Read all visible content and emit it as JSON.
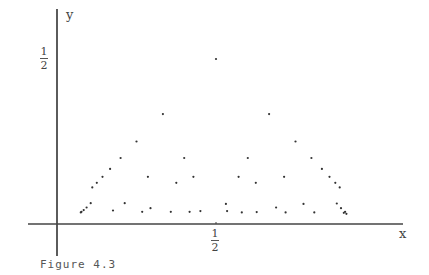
{
  "chart_data": {
    "type": "scatter",
    "title": "",
    "caption": "Figure 4.3",
    "xlabel": "x",
    "ylabel": "y",
    "xlim": [
      0,
      1
    ],
    "ylim": [
      0,
      0.5
    ],
    "grid": false,
    "legend": null,
    "x_ticks": [
      {
        "value": 0.5,
        "label_num": "1",
        "label_den": "2"
      }
    ],
    "y_ticks": [
      {
        "value": 0.5,
        "label_num": "1",
        "label_den": "2"
      }
    ],
    "points": [
      {
        "x": 0.5,
        "y": 0.5
      },
      {
        "x": 0.333,
        "y": 0.333
      },
      {
        "x": 0.667,
        "y": 0.333
      },
      {
        "x": 0.25,
        "y": 0.25
      },
      {
        "x": 0.75,
        "y": 0.25
      },
      {
        "x": 0.2,
        "y": 0.2
      },
      {
        "x": 0.4,
        "y": 0.2
      },
      {
        "x": 0.6,
        "y": 0.2
      },
      {
        "x": 0.8,
        "y": 0.2
      },
      {
        "x": 0.167,
        "y": 0.167
      },
      {
        "x": 0.833,
        "y": 0.167
      },
      {
        "x": 0.143,
        "y": 0.143
      },
      {
        "x": 0.286,
        "y": 0.143
      },
      {
        "x": 0.429,
        "y": 0.143
      },
      {
        "x": 0.571,
        "y": 0.143
      },
      {
        "x": 0.714,
        "y": 0.143
      },
      {
        "x": 0.857,
        "y": 0.143
      },
      {
        "x": 0.125,
        "y": 0.125
      },
      {
        "x": 0.375,
        "y": 0.125
      },
      {
        "x": 0.625,
        "y": 0.125
      },
      {
        "x": 0.875,
        "y": 0.125
      },
      {
        "x": 0.111,
        "y": 0.111
      },
      {
        "x": 0.889,
        "y": 0.111
      },
      {
        "x": 0.106,
        "y": 0.063
      },
      {
        "x": 0.213,
        "y": 0.063
      },
      {
        "x": 0.531,
        "y": 0.061
      },
      {
        "x": 0.775,
        "y": 0.061
      },
      {
        "x": 0.88,
        "y": 0.062
      },
      {
        "x": 0.093,
        "y": 0.05
      },
      {
        "x": 0.294,
        "y": 0.048
      },
      {
        "x": 0.689,
        "y": 0.05
      },
      {
        "x": 0.893,
        "y": 0.048
      },
      {
        "x": 0.084,
        "y": 0.042
      },
      {
        "x": 0.176,
        "y": 0.041
      },
      {
        "x": 0.451,
        "y": 0.039
      },
      {
        "x": 0.535,
        "y": 0.039
      },
      {
        "x": 0.628,
        "y": 0.036
      },
      {
        "x": 0.719,
        "y": 0.035
      },
      {
        "x": 0.809,
        "y": 0.035
      },
      {
        "x": 0.906,
        "y": 0.037
      },
      {
        "x": 0.077,
        "y": 0.037
      },
      {
        "x": 0.075,
        "y": 0.035
      },
      {
        "x": 0.268,
        "y": 0.037
      },
      {
        "x": 0.358,
        "y": 0.037
      },
      {
        "x": 0.417,
        "y": 0.037
      },
      {
        "x": 0.581,
        "y": 0.035
      },
      {
        "x": 0.91,
        "y": 0.031
      },
      {
        "x": 0.902,
        "y": 0.034
      }
    ]
  },
  "labels": {
    "x_axis": "x",
    "y_axis": "y",
    "x_tick_num": "1",
    "x_tick_den": "2",
    "y_tick_num": "1",
    "y_tick_den": "2",
    "caption": "Figure 4.3"
  }
}
